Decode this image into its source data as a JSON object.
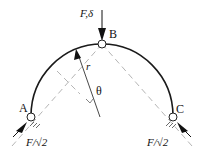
{
  "diagram": {
    "labels": {
      "point_a": "A",
      "point_b": "B",
      "point_c": "C",
      "load": "F,δ",
      "radius": "r",
      "angle": "θ",
      "reaction_a": "F/√2",
      "reaction_c": "F/√2"
    },
    "colors": {
      "arch": "#1a1a1a",
      "dashed": "#b0b0b0",
      "arrow": "#111111"
    }
  }
}
